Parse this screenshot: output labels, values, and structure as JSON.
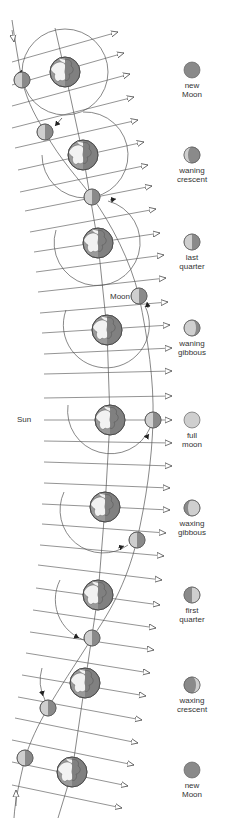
{
  "diagram": {
    "labels": {
      "sun": "Sun",
      "moon": "Moon"
    },
    "phases": [
      {
        "name": "new",
        "line1": "new",
        "line2": "Moon",
        "y": 70,
        "fill": "new"
      },
      {
        "name": "waning-crescent",
        "line1": "waning",
        "line2": "crescent",
        "y": 155,
        "fill": "waning-crescent"
      },
      {
        "name": "last-quarter",
        "line1": "last",
        "line2": "quarter",
        "y": 242,
        "fill": "last-quarter"
      },
      {
        "name": "waning-gibbous",
        "line1": "waning",
        "line2": "gibbous",
        "y": 328,
        "fill": "waning-gibbous"
      },
      {
        "name": "full",
        "line1": "full",
        "line2": "moon",
        "y": 420,
        "fill": "full"
      },
      {
        "name": "waxing-gibbous",
        "line1": "waxing",
        "line2": "gibbous",
        "y": 508,
        "fill": "waxing-gibbous"
      },
      {
        "name": "first-quarter",
        "line1": "first",
        "line2": "quarter",
        "y": 595,
        "fill": "first-quarter"
      },
      {
        "name": "waxing-crescent",
        "line1": "waxing",
        "line2": "crescent",
        "y": 685,
        "fill": "waxing-crescent"
      },
      {
        "name": "new-2",
        "line1": "new",
        "line2": "Moon",
        "y": 770,
        "fill": "new"
      }
    ],
    "colors": {
      "line": "#555555",
      "moon_dark": "#8a8a8a",
      "moon_light": "#cfcfcf",
      "earth_dark": "#7d7d7d",
      "earth_land": "#f2f2f2",
      "earth_ocean": "#9a9a9a"
    }
  }
}
